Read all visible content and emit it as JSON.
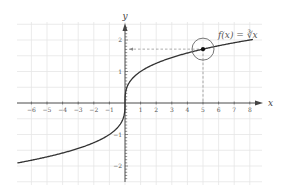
{
  "chart_data": {
    "type": "line",
    "title": "",
    "function_label": "f(x) = ∛x",
    "xlabel": "x",
    "ylabel": "y",
    "xlim": [
      -7,
      8.5
    ],
    "ylim": [
      -2.5,
      2.5
    ],
    "grid": true,
    "x_ticks": [
      -6,
      -5,
      -4,
      -3,
      -2,
      -1,
      1,
      2,
      3,
      4,
      5,
      6,
      7,
      8
    ],
    "x_tick_labels": [
      "−6",
      "−5",
      "−4",
      "−3",
      "−2",
      "−1",
      "1",
      "2",
      "3",
      "4",
      "5",
      "6",
      "7",
      "8"
    ],
    "y_ticks": [
      -2,
      -1,
      1,
      2
    ],
    "y_tick_labels": [
      "−2",
      "−1",
      "1",
      "2"
    ],
    "series": [
      {
        "name": "f(x) = ∛x",
        "x": [
          -6.9,
          -6,
          -5,
          -4,
          -3,
          -2,
          -1,
          -0.5,
          -0.1,
          0,
          0.1,
          0.5,
          1,
          2,
          3,
          4,
          5,
          6,
          7,
          8.2
        ],
        "y": [
          -1.904,
          -1.817,
          -1.71,
          -1.587,
          -1.442,
          -1.26,
          -1,
          -0.794,
          -0.464,
          0,
          0.464,
          0.794,
          1,
          1.26,
          1.442,
          1.587,
          1.71,
          1.817,
          1.913,
          2.017
        ]
      }
    ],
    "highlight_point": {
      "x": 5,
      "y": 1.71,
      "circled": true,
      "dashed_guides": true
    },
    "colors": {
      "curve": "#333333",
      "axis": "#444444",
      "grid": "#e6e6e6",
      "guide": "#888888"
    }
  }
}
